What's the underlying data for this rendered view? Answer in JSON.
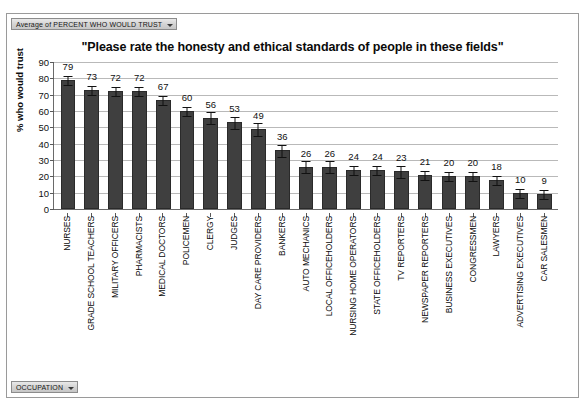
{
  "pivot": {
    "series_field_label": "Average of PERCENT WHO WOULD TRUST",
    "category_field_label": "OCCUPATION"
  },
  "chart_data": {
    "type": "bar",
    "title": "\"Please rate the honesty and ethical standards of people in these fields\"",
    "xlabel": "OCCUPATION",
    "ylabel": "% who would trust",
    "ylim": [
      0,
      90
    ],
    "ytick_step": 10,
    "yticks": [
      "0",
      "10",
      "20",
      "30",
      "40",
      "50",
      "60",
      "70",
      "80",
      "90"
    ],
    "grid": true,
    "legend": "none",
    "error_bars": true,
    "bar_color": "#3f3f3f",
    "categories": [
      "NURSES",
      "GRADE SCHOOL TEACHERS",
      "MILITARY OFFICERS",
      "PHARMACISTS",
      "MEDICAL DOCTORS",
      "POLICEMEN",
      "CLERGY",
      "JUDGES",
      "DAY CARE PROVIDERS",
      "BANKERS",
      "AUTO MECHANICS",
      "LOCAL OFFICEHOLDERS",
      "NURSING HOME OPERATORS",
      "STATE OFFICEHOLDERS",
      "TV REPORTERS",
      "NEWSPAPER REPORTERS",
      "BUSINESS EXECUTIVES",
      "CONGRESSMEN",
      "LAWYERS",
      "ADVERTISING EXECUTIVES",
      "CAR SALESMEN"
    ],
    "values": [
      79,
      73,
      72,
      72,
      67,
      60,
      56,
      53,
      49,
      36,
      26,
      26,
      24,
      24,
      23,
      21,
      20,
      20,
      18,
      10,
      9
    ],
    "errors": [
      3,
      3,
      3,
      3,
      3,
      3,
      4,
      4,
      4,
      4,
      4,
      4,
      3,
      3,
      4,
      3,
      3,
      3,
      3,
      3,
      3
    ]
  }
}
